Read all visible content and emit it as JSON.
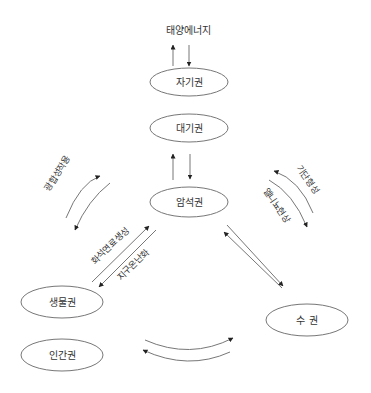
{
  "diagram": {
    "title": "",
    "colors": {
      "stroke": "#777777",
      "text": "#333333",
      "arrow": "#222222",
      "background": "#ffffff"
    },
    "nodes": {
      "solar": {
        "label": "태양에너지"
      },
      "magnetosphere": {
        "label": "자기권"
      },
      "atmosphere": {
        "label": "대기권"
      },
      "lithosphere": {
        "label": "암석권"
      },
      "biosphere": {
        "label": "생물권"
      },
      "hydrosphere": {
        "label": "수 권"
      },
      "anthroposphere": {
        "label": "인간권"
      }
    },
    "edge_labels": {
      "photosynthesis": "광합성작용",
      "air_mass_formation": "기단형성",
      "el_nino": "엘니뇨현상",
      "fossil_fuel_formation": "화석연료생성",
      "global_warming": "지구온난화"
    },
    "edges": [
      {
        "from": "magnetosphere",
        "to": "solar",
        "type": "up-down pair"
      },
      {
        "from": "atmosphere",
        "to": "lithosphere",
        "type": "up-down pair"
      },
      {
        "from": "atmosphere",
        "to": "biosphere",
        "type": "curved pair",
        "label": "광합성작용"
      },
      {
        "from": "atmosphere",
        "to": "hydrosphere",
        "type": "curved pair",
        "labels": [
          "기단형성",
          "엘니뇨현상"
        ]
      },
      {
        "from": "biosphere",
        "to": "lithosphere",
        "type": "diagonal pair",
        "labels": [
          "화석연료생성",
          "지구온난화"
        ]
      },
      {
        "from": "lithosphere",
        "to": "hydrosphere",
        "type": "diagonal pair"
      },
      {
        "from": "anthroposphere",
        "to": "hydrosphere",
        "type": "curved pair"
      }
    ]
  }
}
